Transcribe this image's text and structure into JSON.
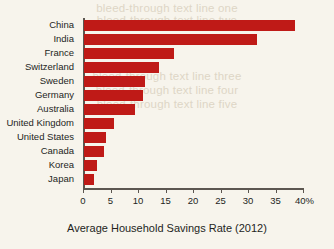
{
  "chart_data": {
    "type": "bar",
    "orientation": "horizontal",
    "title": "",
    "xlabel": "Average Household Savings Rate (2012)",
    "ylabel": "",
    "categories": [
      "China",
      "India",
      "France",
      "Switzerland",
      "Sweden",
      "Germany",
      "Australia",
      "United Kingdom",
      "United States",
      "Canada",
      "Korea",
      "Japan"
    ],
    "values": [
      38.4,
      31.5,
      16.4,
      13.7,
      11.0,
      10.7,
      9.3,
      5.5,
      4.0,
      3.7,
      2.4,
      1.8
    ],
    "unit": "%",
    "xlim": [
      0,
      40
    ],
    "xticks": [
      0,
      5,
      10,
      15,
      20,
      25,
      30,
      35,
      40
    ],
    "xtick_labels": [
      "0",
      "5",
      "10",
      "15",
      "20",
      "25",
      "30",
      "35",
      "40%"
    ],
    "grid": false,
    "legend": false,
    "bar_color": "#bf1a17",
    "axis_color": "#5c5650",
    "background_color": "#f7f4ec"
  },
  "ghost_text": {
    "line1": "bleed-through text line one",
    "line2": "bleed-through text line two",
    "line3": "bleed-through text line three",
    "line4": "bleed-through text line four",
    "line5": "bleed-through text line five"
  }
}
